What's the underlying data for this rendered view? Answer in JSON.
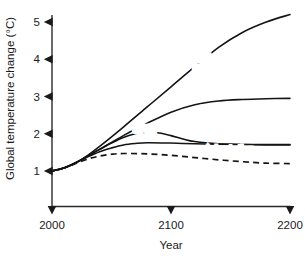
{
  "chart_data": {
    "type": "line",
    "title": "",
    "xlabel": "Year",
    "ylabel": "Global temperature change (°C)",
    "xlim": [
      2000,
      2200
    ],
    "ylim": [
      0.55,
      5.35
    ],
    "xticks": [
      2000,
      2100,
      2200
    ],
    "xticklabels": [
      "2000",
      "2100",
      "2200"
    ],
    "yticks": [
      1,
      2,
      3,
      4,
      5
    ],
    "yticklabels": [
      "1",
      "2",
      "3",
      "4",
      "5"
    ],
    "grid": false,
    "legend_position": "inline-annotations",
    "series": [
      {
        "name": "Business as usual",
        "style": "solid",
        "label": "Business\nas usual",
        "x": [
          2000,
          2010,
          2020,
          2030,
          2040,
          2060,
          2080,
          2100,
          2120,
          2140,
          2160,
          2180,
          2200
        ],
        "values": [
          1.0,
          1.08,
          1.22,
          1.42,
          1.66,
          2.18,
          2.72,
          3.26,
          3.8,
          4.32,
          4.72,
          5.0,
          5.2
        ]
      },
      {
        "name": "Emissions Reduction",
        "style": "solid",
        "label": "Emissions\nReduction",
        "x": [
          2000,
          2010,
          2020,
          2030,
          2040,
          2060,
          2080,
          2100,
          2120,
          2140,
          2160,
          2180,
          2200
        ],
        "values": [
          1.0,
          1.08,
          1.22,
          1.4,
          1.58,
          1.95,
          2.28,
          2.58,
          2.78,
          2.88,
          2.92,
          2.94,
          2.95
        ]
      },
      {
        "name": "Greenhouse gas removal",
        "style": "solid",
        "label": "Greenhouse\ngas removal",
        "x": [
          2000,
          2010,
          2020,
          2030,
          2040,
          2050,
          2060,
          2070,
          2080,
          2100,
          2120,
          2140,
          2160,
          2180,
          2200
        ],
        "values": [
          1.0,
          1.08,
          1.22,
          1.38,
          1.52,
          1.62,
          1.7,
          1.74,
          1.76,
          1.75,
          1.73,
          1.72,
          1.71,
          1.71,
          1.71
        ]
      },
      {
        "name": "SRM",
        "style": "solid",
        "label": "SRM",
        "x": [
          2000,
          2010,
          2020,
          2030,
          2040,
          2050,
          2060,
          2070,
          2080,
          2090,
          2100,
          2110,
          2120,
          2140,
          2160,
          2180,
          2200
        ],
        "values": [
          1.0,
          1.08,
          1.22,
          1.4,
          1.58,
          1.75,
          1.9,
          2.0,
          2.04,
          2.02,
          1.95,
          1.86,
          1.79,
          1.73,
          1.71,
          1.7,
          1.7
        ]
      },
      {
        "name": "Adaptation",
        "style": "dashed",
        "label": "Adaptation",
        "x": [
          2000,
          2010,
          2020,
          2030,
          2040,
          2050,
          2060,
          2080,
          2100,
          2120,
          2140,
          2160,
          2180,
          2200
        ],
        "values": [
          1.0,
          1.08,
          1.2,
          1.32,
          1.4,
          1.45,
          1.47,
          1.46,
          1.42,
          1.36,
          1.3,
          1.25,
          1.21,
          1.2
        ]
      }
    ],
    "annotations": [
      {
        "text": "Business",
        "x": 2035,
        "y": 3.92
      },
      {
        "text": "as usual",
        "x": 2035,
        "y": 3.62
      },
      {
        "text": "Emissions",
        "x": 2118,
        "y": 3.92
      },
      {
        "text": "Reduction",
        "x": 2118,
        "y": 3.62
      },
      {
        "text": "Greenhouse",
        "x": 2122,
        "y": 2.52
      },
      {
        "text": "gas removal",
        "x": 2122,
        "y": 2.22
      },
      {
        "text": "SRM",
        "x": 2068,
        "y": 2.02
      },
      {
        "text": "Adaptation",
        "x": 2128,
        "y": 1.48
      }
    ]
  }
}
